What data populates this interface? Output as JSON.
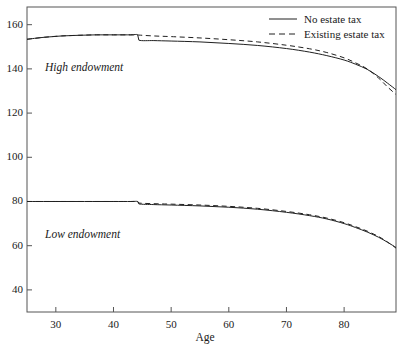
{
  "chart_data": {
    "type": "line",
    "title": "",
    "xlabel": "Age",
    "ylabel": "",
    "xlim": [
      25,
      89
    ],
    "ylim": [
      30,
      168
    ],
    "grid": false,
    "legend_position": "top-right",
    "xticks": [
      30,
      40,
      50,
      60,
      70,
      80
    ],
    "yticks": [
      40,
      60,
      80,
      100,
      120,
      140,
      160
    ],
    "annotations": [
      {
        "text": "High endowment",
        "x": 28,
        "y": 145,
        "style": "italic"
      },
      {
        "text": "Low endowment",
        "x": 28,
        "y": 70,
        "style": "italic"
      }
    ],
    "series": [
      {
        "name": "No estate tax",
        "group": "High endowment",
        "style": "solid",
        "color": "#202020",
        "x": [
          25,
          28,
          31,
          34,
          37,
          40,
          43,
          44.2,
          44.4,
          47,
          50,
          55,
          60,
          65,
          70,
          74,
          77,
          80,
          82,
          84,
          86,
          87.5,
          89
        ],
        "y": [
          153.4,
          154.3,
          154.9,
          155.2,
          155.4,
          155.4,
          155.4,
          155.4,
          153.0,
          152.8,
          152.6,
          152.2,
          151.5,
          150.6,
          149.2,
          147.6,
          146.0,
          144.0,
          142.1,
          139.8,
          136.5,
          133.6,
          130.6
        ]
      },
      {
        "name": "Existing estate tax",
        "group": "High endowment",
        "style": "dashed",
        "color": "#202020",
        "x": [
          25,
          28,
          31,
          34,
          37,
          40,
          43,
          44.2,
          44.4,
          47,
          50,
          55,
          60,
          65,
          70,
          74,
          77,
          80,
          82,
          84,
          86,
          87.5,
          89
        ],
        "y": [
          153.4,
          154.3,
          154.9,
          155.2,
          155.4,
          155.4,
          155.4,
          155.4,
          155.3,
          154.9,
          154.6,
          154.0,
          153.2,
          152.2,
          150.7,
          149.1,
          147.4,
          145.0,
          142.7,
          140.0,
          135.8,
          131.9,
          128.4
        ]
      },
      {
        "name": "No estate tax",
        "group": "Low endowment",
        "style": "solid",
        "color": "#202020",
        "x": [
          25,
          30,
          35,
          40,
          43,
          44.2,
          44.4,
          47,
          50,
          55,
          60,
          65,
          70,
          74,
          77,
          80,
          82,
          84,
          86,
          87.5,
          89
        ],
        "y": [
          80.0,
          80.0,
          80.0,
          80.0,
          80.0,
          80.0,
          78.9,
          78.6,
          78.4,
          78.0,
          77.4,
          76.5,
          75.1,
          73.6,
          72.1,
          70.0,
          68.2,
          66.2,
          63.8,
          61.6,
          59.2
        ]
      },
      {
        "name": "Existing estate tax",
        "group": "Low endowment",
        "style": "dashed",
        "color": "#202020",
        "x": [
          25,
          30,
          35,
          40,
          43,
          44.2,
          44.4,
          47,
          50,
          55,
          60,
          65,
          70,
          74,
          77,
          80,
          82,
          84,
          86,
          87.5,
          89
        ],
        "y": [
          80.0,
          80.0,
          80.0,
          80.0,
          80.0,
          80.0,
          79.3,
          79.0,
          78.8,
          78.4,
          77.8,
          76.9,
          75.5,
          74.0,
          72.5,
          70.4,
          68.6,
          66.6,
          64.1,
          61.7,
          58.9
        ]
      }
    ]
  },
  "legend": {
    "items": [
      {
        "label": "No estate tax",
        "style": "solid"
      },
      {
        "label": "Existing estate tax",
        "style": "dashed"
      }
    ]
  },
  "axes": {
    "x_title": "Age",
    "x_tick_labels": [
      "30",
      "40",
      "50",
      "60",
      "70",
      "80"
    ],
    "y_tick_labels": [
      "40",
      "60",
      "80",
      "100",
      "120",
      "140",
      "160"
    ]
  },
  "annotations": {
    "high": "High endowment",
    "low": "Low endowment"
  },
  "colors": {
    "line": "#202020",
    "frame": "#444444",
    "background": "#ffffff"
  }
}
